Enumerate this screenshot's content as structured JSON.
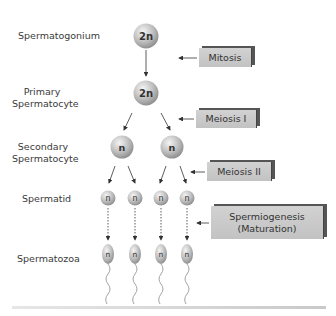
{
  "stages": [
    {
      "label": "Spermatogonium",
      "ploidy": "2n"
    },
    {
      "label": "Primary\nSpermatocyte",
      "ploidy": "2n"
    },
    {
      "label": "Secondary\nSpermatocyte",
      "ploidy": "n"
    },
    {
      "label": "Spermatid",
      "ploidy": "n"
    },
    {
      "label": "Spermatozoa",
      "ploidy": "n"
    }
  ],
  "stage_labels": {
    "spermatogonium": "Spermatogonium",
    "primary_l1": "Primary",
    "primary_l2": "Spermatocyte",
    "secondary_l1": "Secondary",
    "secondary_l2": "Spermatocyte",
    "spermatid": "Spermatid",
    "spermatozoa": "Spermatozoa"
  },
  "processes": {
    "mitosis": "Mitosis",
    "meiosis1": "Meiosis I",
    "meiosis2": "Meiosis II",
    "spermiogenesis_l1": "Spermiogenesis",
    "spermiogenesis_l2": "(Maturation)"
  },
  "cells": {
    "spermatogonium": "2n",
    "primary": "2n",
    "secondary": [
      "n",
      "n"
    ],
    "spermatid": [
      "n",
      "n",
      "n",
      "n"
    ],
    "spermatozoa": [
      "n",
      "n",
      "n",
      "n"
    ]
  },
  "colors": {
    "cell_light": "#eeeeee",
    "cell_dark": "#9a9a9a",
    "box_fill": "#c8c8c8",
    "box_shadow": "#555555",
    "arrow": "#333333"
  }
}
